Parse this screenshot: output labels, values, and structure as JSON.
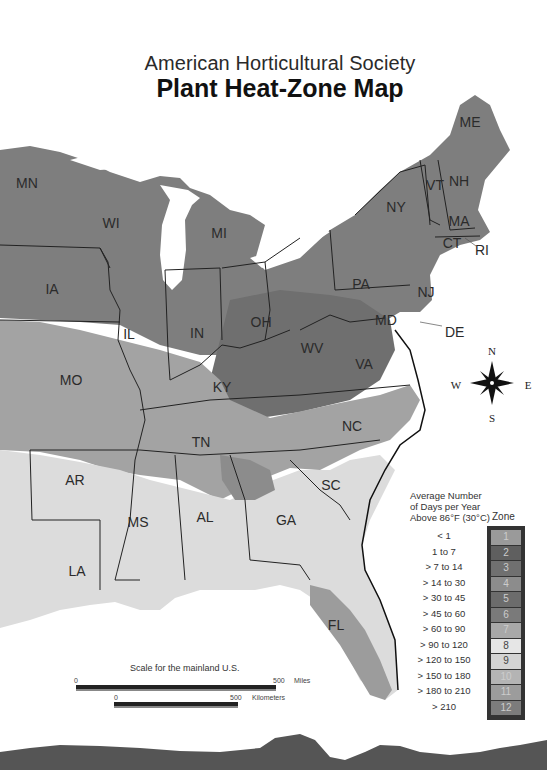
{
  "header": {
    "subtitle": "American Horticultural Society",
    "title": "Plant Heat-Zone Map"
  },
  "states": [
    {
      "abbr": "ME",
      "x": 470,
      "y": 122
    },
    {
      "abbr": "MN",
      "x": 27,
      "y": 183
    },
    {
      "abbr": "WI",
      "x": 111,
      "y": 223
    },
    {
      "abbr": "MI",
      "x": 219,
      "y": 233
    },
    {
      "abbr": "NY",
      "x": 396,
      "y": 207
    },
    {
      "abbr": "VT",
      "x": 435,
      "y": 185
    },
    {
      "abbr": "NH",
      "x": 459,
      "y": 181
    },
    {
      "abbr": "MA",
      "x": 459,
      "y": 221
    },
    {
      "abbr": "CT",
      "x": 452,
      "y": 243
    },
    {
      "abbr": "IA",
      "x": 52,
      "y": 289
    },
    {
      "abbr": "PA",
      "x": 361,
      "y": 284
    },
    {
      "abbr": "NJ",
      "x": 426,
      "y": 292
    },
    {
      "abbr": "IL",
      "x": 129,
      "y": 334
    },
    {
      "abbr": "IN",
      "x": 197,
      "y": 333
    },
    {
      "abbr": "OH",
      "x": 261,
      "y": 322
    },
    {
      "abbr": "MD",
      "x": 386,
      "y": 320
    },
    {
      "abbr": "WV",
      "x": 312,
      "y": 348
    },
    {
      "abbr": "VA",
      "x": 364,
      "y": 364
    },
    {
      "abbr": "MO",
      "x": 71,
      "y": 380
    },
    {
      "abbr": "KY",
      "x": 222,
      "y": 387
    },
    {
      "abbr": "TN",
      "x": 201,
      "y": 442
    },
    {
      "abbr": "NC",
      "x": 352,
      "y": 426
    },
    {
      "abbr": "AR",
      "x": 75,
      "y": 480
    },
    {
      "abbr": "SC",
      "x": 331,
      "y": 485
    },
    {
      "abbr": "MS",
      "x": 138,
      "y": 522
    },
    {
      "abbr": "AL",
      "x": 205,
      "y": 517
    },
    {
      "abbr": "GA",
      "x": 286,
      "y": 520
    },
    {
      "abbr": "LA",
      "x": 77,
      "y": 571
    },
    {
      "abbr": "FL",
      "x": 336,
      "y": 625
    }
  ],
  "callouts": [
    {
      "abbr": "RI",
      "x": 475,
      "y": 242
    },
    {
      "abbr": "DE",
      "x": 445,
      "y": 324
    }
  ],
  "compass": {
    "north": "N",
    "south": "S",
    "east": "E",
    "west": "W"
  },
  "legend": {
    "heading": "Average Number of Days per Year Above 86°F (30°C)",
    "zone_heading": "Zone",
    "zones": [
      {
        "zone": "1",
        "range": "< 1",
        "color": "#9a9a9a"
      },
      {
        "zone": "2",
        "range": "1 to 7",
        "color": "#5f5f5f"
      },
      {
        "zone": "3",
        "range": "> 7 to 14",
        "color": "#707070"
      },
      {
        "zone": "4",
        "range": "> 14 to 30",
        "color": "#8c8c8c"
      },
      {
        "zone": "5",
        "range": "> 30 to 45",
        "color": "#6c6c6c"
      },
      {
        "zone": "6",
        "range": "> 45 to 60",
        "color": "#7a7a7a"
      },
      {
        "zone": "7",
        "range": "> 60 to 90",
        "color": "#a8a8a8"
      },
      {
        "zone": "8",
        "range": "> 90 to 120",
        "color": "#e6e6e6"
      },
      {
        "zone": "9",
        "range": "> 120 to 150",
        "color": "#d4d4d4"
      },
      {
        "zone": "10",
        "range": "> 150 to 180",
        "color": "#b4b4b4"
      },
      {
        "zone": "11",
        "range": "> 180 to 210",
        "color": "#9c9c9c"
      },
      {
        "zone": "12",
        "range": "> 210",
        "color": "#7c7c7c"
      }
    ]
  },
  "scale": {
    "title": "Scale for the mainland U.S.",
    "miles": {
      "start": "0",
      "end": "500",
      "unit": "Miles"
    },
    "km": {
      "start": "0",
      "end": "500",
      "unit": "Kilometers"
    }
  }
}
